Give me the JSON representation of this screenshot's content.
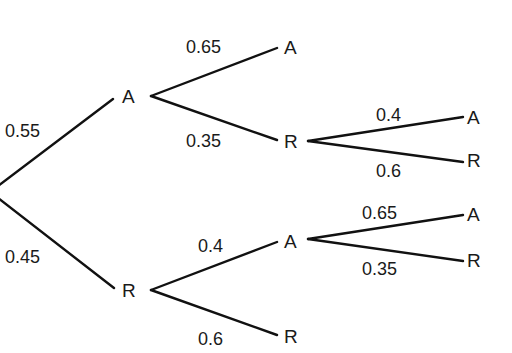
{
  "diagram": {
    "type": "probability-tree",
    "root": {
      "branches": [
        {
          "probability": "0.55",
          "outcome": "A",
          "branches": [
            {
              "probability": "0.65",
              "outcome": "A"
            },
            {
              "probability": "0.35",
              "outcome": "R",
              "branches": [
                {
                  "probability": "0.4",
                  "outcome": "A"
                },
                {
                  "probability": "0.6",
                  "outcome": "R"
                }
              ]
            }
          ]
        },
        {
          "probability": "0.45",
          "outcome": "R",
          "branches": [
            {
              "probability": "0.4",
              "outcome": "A",
              "branches": [
                {
                  "probability": "0.65",
                  "outcome": "A"
                },
                {
                  "probability": "0.35",
                  "outcome": "R"
                }
              ]
            },
            {
              "probability": "0.6",
              "outcome": "R"
            }
          ]
        }
      ]
    }
  },
  "colors": {
    "line": "#111111",
    "text": "#1a1a1a",
    "background": "#ffffff"
  }
}
